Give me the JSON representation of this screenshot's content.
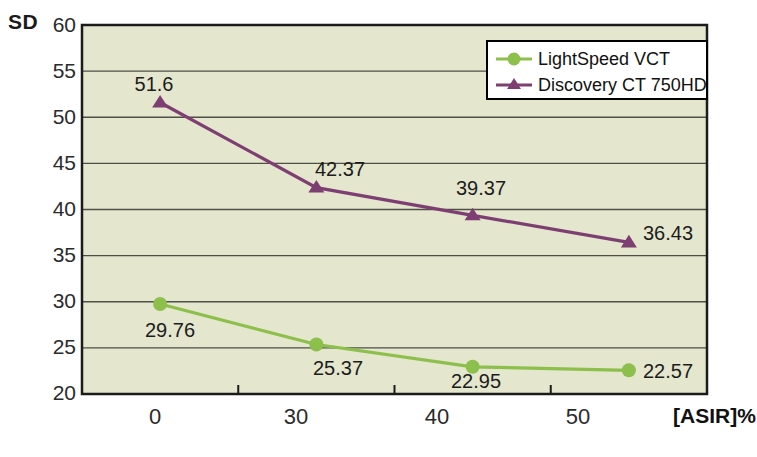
{
  "chart_data": {
    "type": "line",
    "title": "",
    "xlabel": "[ASIR]%",
    "ylabel": "SD",
    "categories": [
      "0",
      "30",
      "40",
      "50"
    ],
    "x": [
      0,
      30,
      40,
      50
    ],
    "ylim": [
      20,
      60
    ],
    "yticks": [
      "60",
      "55",
      "50",
      "45",
      "40",
      "35",
      "30",
      "25",
      "20"
    ],
    "ytick_values": [
      60,
      55,
      50,
      45,
      40,
      35,
      30,
      25,
      20
    ],
    "grid": true,
    "grid_axis": "y",
    "legend_position": "top-right",
    "series": [
      {
        "name": "LightSpeed VCT",
        "values": [
          29.76,
          22.57,
          25.37,
          22.95
        ],
        "ordered_values": [
          29.76,
          25.37,
          22.95,
          22.57
        ],
        "labels": [
          "29.76",
          "25.37",
          "22.95",
          "22.57"
        ],
        "color": "#8cbf4b",
        "marker": "circle"
      },
      {
        "name": "Discovery CT 750HD",
        "values": [
          51.6,
          42.37,
          39.37,
          36.43
        ],
        "ordered_values": [
          51.6,
          42.37,
          39.37,
          36.43
        ],
        "labels": [
          "51.6",
          "42.37",
          "39.37",
          "36.43"
        ],
        "color": "#7d3f72",
        "marker": "triangle"
      }
    ]
  },
  "axes": {
    "y_title": "SD",
    "x_title": "[ASIR]%",
    "y_ticks": [
      {
        "label": "60"
      },
      {
        "label": "55"
      },
      {
        "label": "50"
      },
      {
        "label": "45"
      },
      {
        "label": "40"
      },
      {
        "label": "35"
      },
      {
        "label": "30"
      },
      {
        "label": "25"
      },
      {
        "label": "20"
      }
    ],
    "x_ticks": [
      {
        "label": "0"
      },
      {
        "label": "30"
      },
      {
        "label": "40"
      },
      {
        "label": "50"
      }
    ]
  },
  "legend": {
    "items": [
      {
        "label": "LightSpeed VCT",
        "color": "#8cbf4b",
        "marker": "circle-marker"
      },
      {
        "label": "Discovery CT 750HD",
        "color": "#7d3f72",
        "marker": "triangle-marker"
      }
    ]
  },
  "point_labels": {
    "green": [
      {
        "text": "29.76"
      },
      {
        "text": "25.37"
      },
      {
        "text": "22.95"
      },
      {
        "text": "22.57"
      }
    ],
    "purple": [
      {
        "text": "51.6"
      },
      {
        "text": "42.37"
      },
      {
        "text": "39.37"
      },
      {
        "text": "36.43"
      }
    ]
  },
  "colors": {
    "plot_background": "#e4e6cd",
    "green_series": "#8cbf4b",
    "purple_series": "#7d3f72",
    "gridline": "#4f4f47",
    "axis_line": "#1b1b1b",
    "page_background": "#ffffff"
  }
}
